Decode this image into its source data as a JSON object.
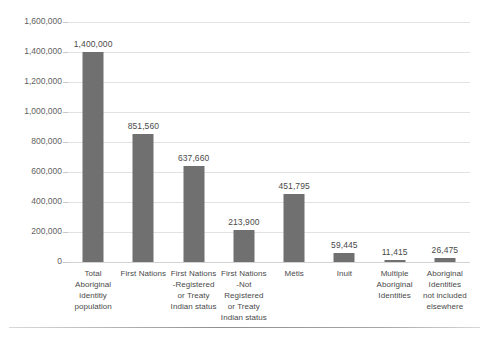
{
  "chart_data": {
    "type": "bar",
    "title": "",
    "subtitle": "",
    "xlabel": "",
    "ylabel": "",
    "ylim": [
      0,
      1600000
    ],
    "ytick_step": 200000,
    "grid": true,
    "legend": false,
    "legend_position": "none",
    "bar_color": "#707070",
    "gridline_color": "#e2e2e2",
    "text_color": "#4a4a4a",
    "axis_label_color": "#5f5f5f",
    "categories": [
      "Total Aboriginal identitiy population",
      "First Nations",
      "First Nations -Registered or Treaty Indian status",
      "First Nations -Not Registered or Treaty Indian status",
      "Métis",
      "Inuit",
      "Multiple Aboriginal Identities",
      "Aboriginal Identities not included elsewhere"
    ],
    "category_lines": [
      [
        "Total",
        "Aboriginal",
        "identitiy",
        "population"
      ],
      [
        "First Nations"
      ],
      [
        "First Nations",
        "-Registered",
        "or Treaty",
        "Indian status"
      ],
      [
        "First Nations",
        "-Not Registered",
        "or Treaty",
        "Indian status"
      ],
      [
        "Métis"
      ],
      [
        "Inuit"
      ],
      [
        "Multiple",
        "Aboriginal",
        "Identities"
      ],
      [
        "Aboriginal",
        "Identities",
        "not included",
        "elsewhere"
      ]
    ],
    "values": [
      1400000,
      851560,
      637660,
      213900,
      451795,
      59445,
      11415,
      26475
    ],
    "value_labels": [
      "1,400,000",
      "851,560",
      "637,660",
      "213,900",
      "451,795",
      "59,445",
      "11,415",
      "26,475"
    ],
    "ytick_labels": [
      "1,600,000",
      "1,400,000",
      "1,200,000",
      "1,000,000",
      "800,000",
      "600,000",
      "400,000",
      "200,000",
      "0"
    ],
    "ytick_values": [
      1600000,
      1400000,
      1200000,
      1000000,
      800000,
      600000,
      400000,
      200000,
      0
    ]
  }
}
